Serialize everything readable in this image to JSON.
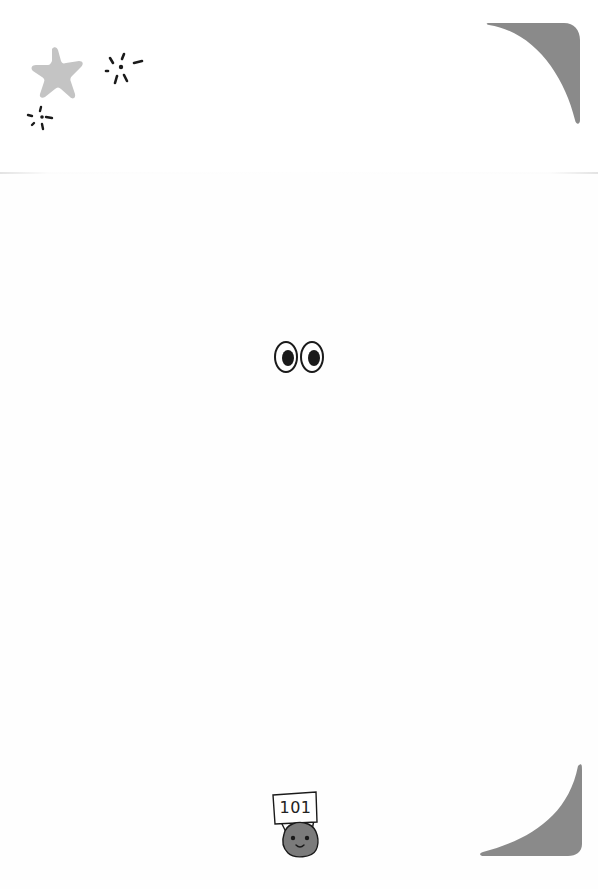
{
  "page": {
    "number": "101",
    "background": "#fefefe"
  },
  "decorations": {
    "star": {
      "color": "#c4c4c4"
    },
    "corner_top_right": {
      "color": "#8a8a8a"
    },
    "corner_bottom_right": {
      "color": "#8a8a8a"
    },
    "eyes": {
      "stroke": "#1a1a1a",
      "pupil": "#1a1a1a"
    },
    "mascot": {
      "body": "#7b7b7b",
      "outline": "#1a1a1a"
    }
  }
}
